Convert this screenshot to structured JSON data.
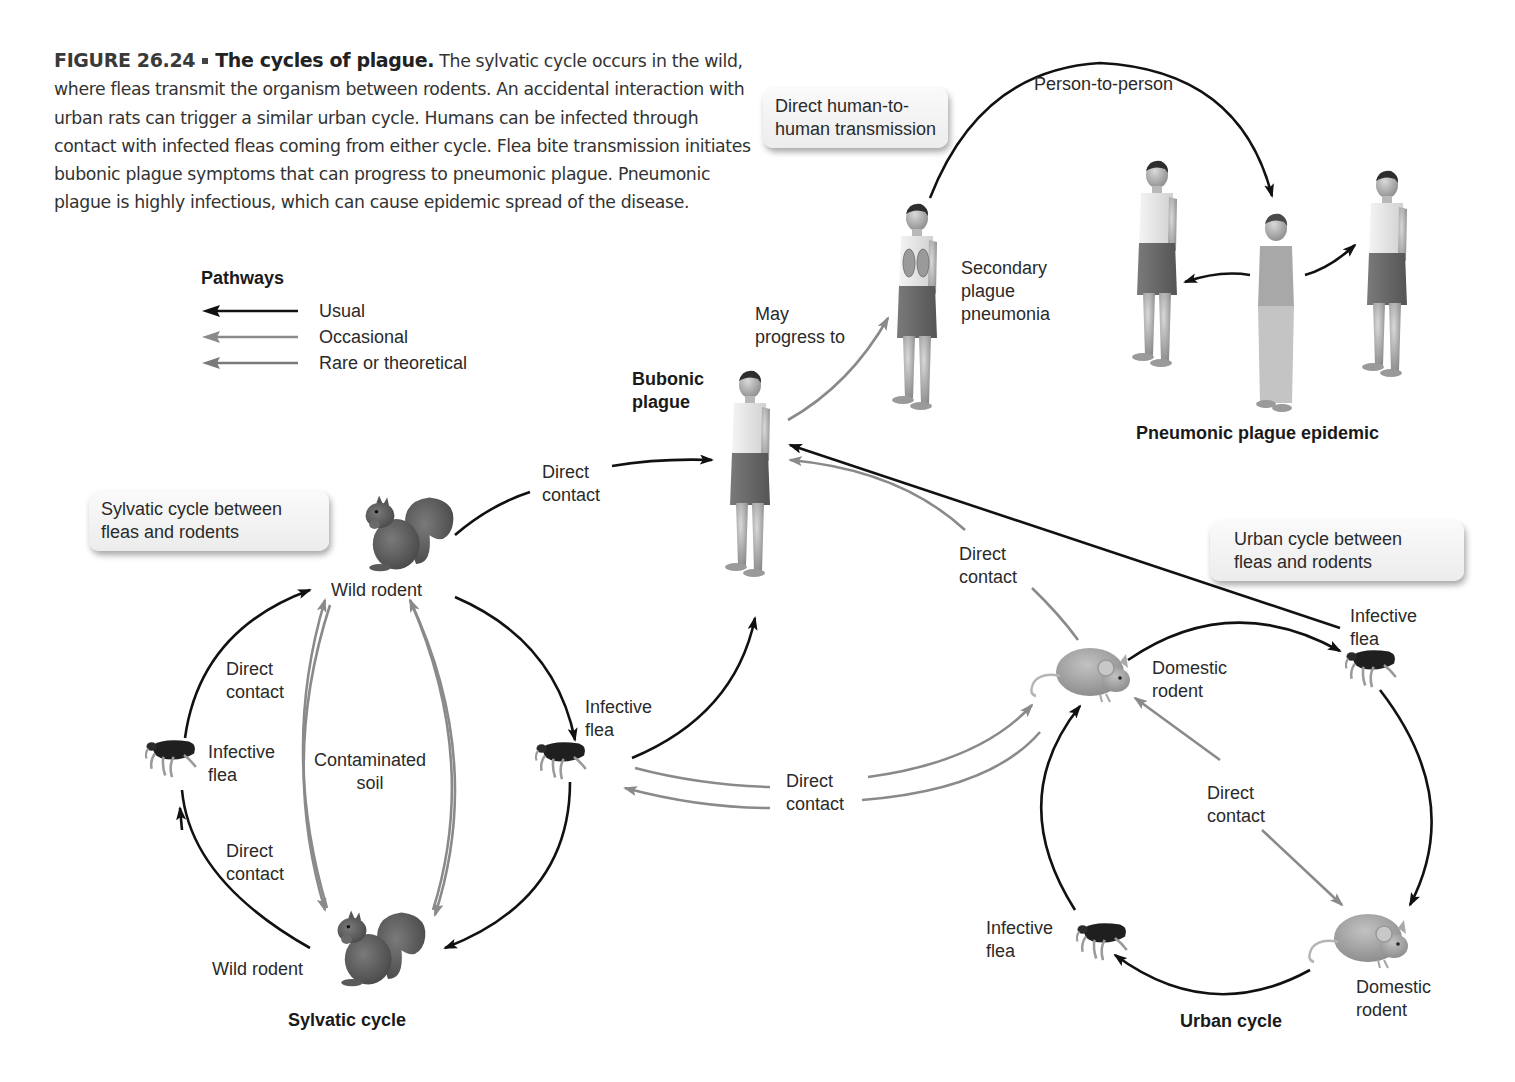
{
  "caption": {
    "figure_number": "FIGURE 26.24",
    "title": "The cycles of plague.",
    "text": "The sylvatic cycle occurs in the wild, where fleas transmit the organism between rodents. An accidental interaction with urban rats can trigger a similar urban cycle. Humans can be infected through contact with infected fleas coming from either cycle. Flea bite transmission initiates bubonic plague symptoms that can progress to pneumonic plague. Pneumonic plague is highly infectious, which can cause epidemic spread of the disease."
  },
  "legend": {
    "title": "Pathways",
    "items": [
      {
        "label": "Usual",
        "color": "#111111"
      },
      {
        "label": "Occasional",
        "color": "#8a8a8a"
      },
      {
        "label": "Rare or theoretical",
        "color": "#7a7a7a"
      }
    ]
  },
  "callouts": {
    "human": "Direct human-to-\nhuman transmission",
    "sylvatic": "Sylvatic cycle between\nfleas and rodents",
    "urban": "Urban cycle between\nfleas and rodents"
  },
  "labels": {
    "person_to_person": "Person-to-person",
    "secondary_pneumonia": "Secondary\nplague\npneumonia",
    "may_progress": "May\nprogress to",
    "bubonic": "Bubonic\nplague",
    "pneumonic_epidemic": "Pneumonic plague epidemic",
    "direct_contact": "Direct\ncontact",
    "wild_rodent": "Wild rodent",
    "infective_flea": "Infective\nflea",
    "contaminated_soil": "Contaminated\nsoil",
    "sylvatic_cycle": "Sylvatic cycle",
    "domestic_rodent": "Domestic\nrodent",
    "urban_cycle": "Urban cycle"
  },
  "colors": {
    "usual": "#111111",
    "occasional": "#8a8a8a",
    "rare": "#7a7a7a",
    "callout_bg": "#f2f2f2"
  }
}
